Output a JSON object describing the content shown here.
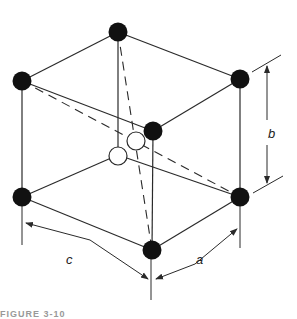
{
  "figure": {
    "type": "crystal unit cell (orthorhombic, with interior atoms)",
    "labels": {
      "a": "a",
      "b": "b",
      "c": "c"
    },
    "caption": "FIGURE 3-10",
    "colors": {
      "dark_atom": "#111111",
      "light_atom": "#ffffff",
      "line": "#2a2a2a"
    }
  }
}
